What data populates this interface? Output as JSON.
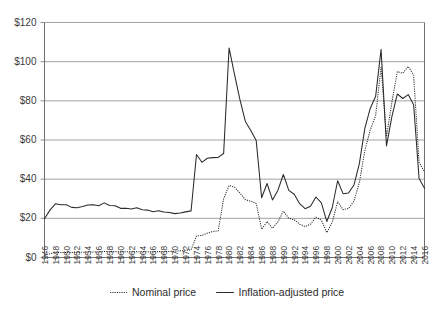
{
  "chart_data": {
    "type": "line",
    "title": "",
    "subtitle": "",
    "xlabel": "",
    "ylabel": "",
    "xlim": [
      1946,
      2016
    ],
    "ylim": [
      0,
      120
    ],
    "grid": "horizontal",
    "legend_position": "bottom-center",
    "y_ticks": [
      0,
      20,
      40,
      60,
      80,
      100,
      120
    ],
    "y_tick_labels": [
      "$0",
      "$20",
      "$40",
      "$60",
      "$80",
      "$100",
      "$120"
    ],
    "x_ticks": [
      1946,
      1948,
      1950,
      1952,
      1954,
      1956,
      1958,
      1960,
      1962,
      1964,
      1966,
      1968,
      1970,
      1972,
      1974,
      1976,
      1978,
      1980,
      1982,
      1984,
      1986,
      1988,
      1990,
      1992,
      1994,
      1996,
      1998,
      2000,
      2002,
      2004,
      2006,
      2008,
      2010,
      2012,
      2014,
      2016
    ],
    "x_tick_labels": [
      "1946",
      "1948",
      "1950",
      "1952",
      "1954",
      "1956",
      "1958",
      "1960",
      "1962",
      "1964",
      "1966",
      "1968",
      "1970",
      "1972",
      "1974",
      "1976",
      "1978",
      "1980",
      "1982",
      "1984",
      "1986",
      "1988",
      "1990",
      "1992",
      "1994",
      "1996",
      "1998",
      "2000",
      "2002",
      "2004",
      "2006",
      "2008",
      "2010",
      "2012",
      "2014",
      "2016"
    ],
    "x": [
      1946,
      1947,
      1948,
      1949,
      1950,
      1951,
      1952,
      1953,
      1954,
      1955,
      1956,
      1957,
      1958,
      1959,
      1960,
      1961,
      1962,
      1963,
      1964,
      1965,
      1966,
      1967,
      1968,
      1969,
      1970,
      1971,
      1972,
      1973,
      1974,
      1975,
      1976,
      1977,
      1978,
      1979,
      1980,
      1981,
      1982,
      1983,
      1984,
      1985,
      1986,
      1987,
      1988,
      1989,
      1990,
      1991,
      1992,
      1993,
      1994,
      1995,
      1996,
      1997,
      1998,
      1999,
      2000,
      2001,
      2002,
      2003,
      2004,
      2005,
      2006,
      2007,
      2008,
      2009,
      2010,
      2011,
      2012,
      2013,
      2014,
      2015,
      2016
    ],
    "series": [
      {
        "name": "Nominal price",
        "style": "dotted",
        "color": "#2b2b2b",
        "values": [
          1.2,
          1.9,
          2.6,
          2.5,
          2.6,
          2.6,
          2.6,
          2.7,
          2.8,
          2.8,
          2.8,
          3.1,
          3.0,
          3.0,
          2.9,
          2.9,
          2.9,
          3.0,
          2.9,
          2.9,
          2.9,
          3.0,
          3.0,
          3.1,
          3.2,
          3.4,
          3.6,
          3.9,
          11.0,
          11.3,
          12.4,
          13.3,
          13.6,
          30.0,
          36.8,
          35.9,
          32.9,
          29.5,
          28.8,
          27.5,
          14.4,
          18.4,
          14.9,
          18.2,
          23.7,
          20.0,
          19.3,
          17.0,
          15.8,
          17.0,
          20.6,
          19.1,
          12.7,
          17.9,
          28.5,
          24.4,
          25.0,
          28.8,
          38.3,
          54.5,
          65.1,
          72.4,
          97.3,
          61.7,
          79.5,
          94.9,
          94.1,
          97.6,
          93.2,
          48.7,
          43.7
        ]
      },
      {
        "name": "Inflation-adjusted price",
        "style": "solid",
        "color": "#2b2b2b",
        "values": [
          19.8,
          24.2,
          27.4,
          26.9,
          26.9,
          25.6,
          25.4,
          26.0,
          26.8,
          26.9,
          26.4,
          27.9,
          26.6,
          26.4,
          25.1,
          25.1,
          24.8,
          25.4,
          24.4,
          24.2,
          23.4,
          23.9,
          23.2,
          23.0,
          22.4,
          22.7,
          23.3,
          23.8,
          52.6,
          48.6,
          50.7,
          51.0,
          51.1,
          53.1,
          107.0,
          93.5,
          80.6,
          69.5,
          64.8,
          59.7,
          30.5,
          37.8,
          29.4,
          34.4,
          42.4,
          34.3,
          32.3,
          27.5,
          24.9,
          26.2,
          30.9,
          27.9,
          18.4,
          25.4,
          39.2,
          32.6,
          32.9,
          37.0,
          47.9,
          65.8,
          76.1,
          82.3,
          106.3,
          57.0,
          72.1,
          83.5,
          81.2,
          83.2,
          78.0,
          40.4,
          35.3
        ]
      }
    ],
    "legend": [
      {
        "label": "Nominal price",
        "style": "dotted",
        "color": "#2b2b2b"
      },
      {
        "label": "Inflation-adjusted price",
        "style": "solid",
        "color": "#2b2b2b"
      }
    ]
  }
}
